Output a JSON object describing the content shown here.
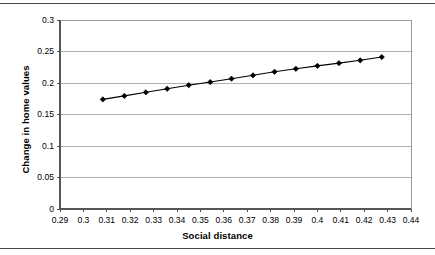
{
  "figure": {
    "top_rule": "horizontal-rule",
    "bottom_rule": "horizontal-rule"
  },
  "chart_data": {
    "type": "line",
    "title": "",
    "xlabel": "Social distance",
    "ylabel": "Change in home values",
    "xlim": [
      0.29,
      0.44
    ],
    "ylim": [
      0,
      0.3
    ],
    "xticks": [
      "0.29",
      "0.3",
      "0.31",
      "0.32",
      "0.33",
      "0.34",
      "0.35",
      "0.36",
      "0.37",
      "0.38",
      "0.39",
      "0.4",
      "0.41",
      "0.42",
      "0.43",
      "0.44"
    ],
    "xtick_values": [
      0.29,
      0.3,
      0.31,
      0.32,
      0.33,
      0.34,
      0.35,
      0.36,
      0.37,
      0.38,
      0.39,
      0.4,
      0.41,
      0.42,
      0.43,
      0.44
    ],
    "yticks": [
      "0",
      "0.05",
      "0.1",
      "0.15",
      "0.2",
      "0.25",
      "0.3"
    ],
    "ytick_values": [
      0,
      0.05,
      0.1,
      0.15,
      0.2,
      0.25,
      0.3
    ],
    "grid": {
      "horizontal": true,
      "vertical": false,
      "color": "#b0b0b0"
    },
    "legend": null,
    "series": [
      {
        "name": "Change in home values",
        "marker": "diamond",
        "color": "#000000",
        "line_color": "#000000",
        "x": [
          0.3083,
          0.3175,
          0.3267,
          0.3358,
          0.345,
          0.3542,
          0.3633,
          0.3725,
          0.3817,
          0.3908,
          0.4,
          0.4092,
          0.4183,
          0.4275
        ],
        "y": [
          0.174,
          0.1795,
          0.1852,
          0.1908,
          0.1965,
          0.2015,
          0.2068,
          0.2122,
          0.2178,
          0.2225,
          0.2272,
          0.2315,
          0.236,
          0.2412
        ]
      }
    ]
  }
}
